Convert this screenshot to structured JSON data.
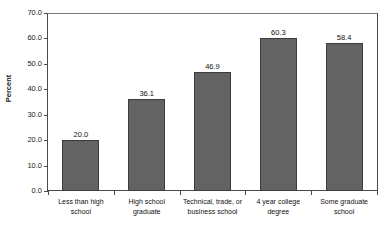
{
  "chart_data": {
    "type": "bar",
    "title": "",
    "xlabel": "",
    "ylabel": "Percent",
    "ylim": [
      0.0,
      70.0
    ],
    "ytick_step": 10.0,
    "grid": false,
    "legend": null,
    "bar_color": "#636363",
    "bar_edge_color": "#3d3d3d",
    "categories": [
      "Less than high school",
      "High school graduate",
      "Technical, trade, or business school",
      "4 year college degree",
      "Some graduate school"
    ],
    "category_lines": [
      [
        "Less than high school"
      ],
      [
        "High school graduate"
      ],
      [
        "Technical, trade, or",
        "business school"
      ],
      [
        "4 year college degree"
      ],
      [
        "Some graduate school"
      ]
    ],
    "values": [
      20.0,
      36.1,
      46.9,
      60.3,
      58.4
    ],
    "value_labels": [
      "20.0",
      "36.1",
      "46.9",
      "60.3",
      "58.4"
    ],
    "ytick_labels": [
      "70.0",
      "60.0",
      "50.0",
      "40.0",
      "30.0",
      "20.0",
      "10.0",
      "0.0"
    ],
    "ytick_values": [
      70.0,
      60.0,
      50.0,
      40.0,
      30.0,
      20.0,
      10.0,
      0.0
    ]
  }
}
